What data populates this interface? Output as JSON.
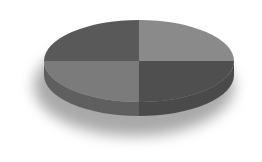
{
  "chart_data": {
    "type": "pie",
    "style": "3d",
    "title": "",
    "categories": [
      "Slice 1",
      "Slice 2",
      "Slice 3",
      "Slice 4"
    ],
    "values": [
      25,
      25,
      25,
      25
    ],
    "legend": "none",
    "data_labels": "none",
    "slices": [
      {
        "position": "top-right",
        "value": 25,
        "color": "#8a8a8a",
        "side_color": "#6e6e6e"
      },
      {
        "position": "bottom-right",
        "value": 25,
        "color": "#4f4f4f",
        "side_color": "#4a4a4a"
      },
      {
        "position": "bottom-left",
        "value": 25,
        "color": "#7b7b7b",
        "side_color": "#5f5f5f"
      },
      {
        "position": "top-left",
        "value": 25,
        "color": "#595959",
        "side_color": "#505050"
      }
    ]
  },
  "colors": {
    "background": "#ffffff",
    "shadow": "#9a9a9a"
  }
}
